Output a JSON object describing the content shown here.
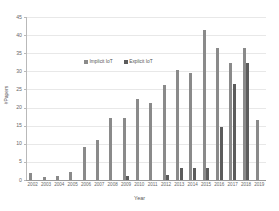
{
  "chart_data": {
    "type": "bar",
    "title": "",
    "xlabel": "Year",
    "ylabel": "#Papers",
    "categories": [
      "2002",
      "2003",
      "2004",
      "2005",
      "2006",
      "2007",
      "2008",
      "2009",
      "2010",
      "2011",
      "2012",
      "2013",
      "2014",
      "2015",
      "2016",
      "2017",
      "2018",
      "2019"
    ],
    "series": [
      {
        "name": "Implicit IoT",
        "color": "#8a8a8a",
        "values": [
          2.0,
          0.8,
          1.0,
          2.1,
          9.2,
          11.1,
          17.2,
          17.2,
          22.3,
          21.2,
          26.2,
          30.4,
          29.5,
          41.4,
          36.4,
          32.4,
          36.4,
          16.5
        ]
      },
      {
        "name": "Explicit IoT",
        "color": "#5c5c5c",
        "values": [
          0,
          0,
          0,
          0,
          0,
          0,
          0,
          1.2,
          0,
          0,
          1.3,
          3.4,
          3.4,
          3.4,
          14.6,
          26.4,
          32.4,
          0
        ]
      }
    ],
    "ylim": [
      0,
      45
    ],
    "yticks": [
      0,
      5,
      10,
      15,
      20,
      25,
      30,
      35,
      40,
      45
    ],
    "grid": true,
    "legend_position": "upper-center-inside"
  },
  "legend": {
    "entries": [
      {
        "label": "Implicit IoT",
        "color": "#8a8a8a"
      },
      {
        "label": "Explicit IoT",
        "color": "#5c5c5c"
      }
    ]
  },
  "axes": {
    "x_title": "Year",
    "y_title": "#Papers"
  }
}
